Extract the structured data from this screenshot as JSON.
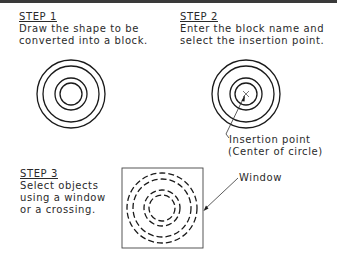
{
  "diagram": {
    "border_color": "#3a3a3a",
    "line_color": "#1a1a1a",
    "steps": [
      {
        "heading": "STEP 1",
        "lines": [
          "Draw the shape to be",
          "converted into a block."
        ],
        "figure": "concentric-circles-solid"
      },
      {
        "heading": "STEP 2",
        "lines": [
          "Enter the block name and",
          "select the insertion point."
        ],
        "figure": "concentric-circles-solid-with-center-mark",
        "callout": [
          "Insertion point",
          "(Center of circle)"
        ]
      },
      {
        "heading": "STEP 3",
        "lines": [
          "Select objects",
          "using a window",
          "or a crossing."
        ],
        "figure": "dashed-concentric-circles-in-window",
        "callout": [
          "Window"
        ]
      }
    ]
  }
}
